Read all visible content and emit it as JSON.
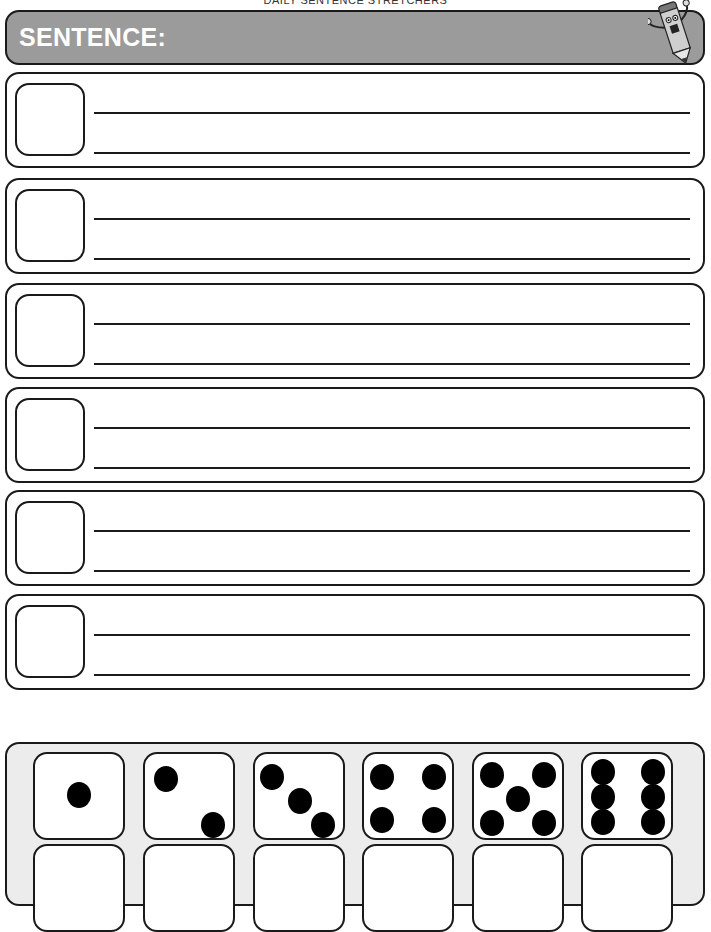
{
  "document": {
    "title": "DAILY SENTENCE STRETCHERS"
  },
  "header": {
    "label": "SENTENCE:",
    "mascot_icon": "pencil-mascot-icon",
    "background_color": "#9b9b9b"
  },
  "sentence_rows": [
    {
      "index": 1,
      "number_box": "",
      "lines": [
        "",
        ""
      ]
    },
    {
      "index": 2,
      "number_box": "",
      "lines": [
        "",
        ""
      ]
    },
    {
      "index": 3,
      "number_box": "",
      "lines": [
        "",
        ""
      ]
    },
    {
      "index": 4,
      "number_box": "",
      "lines": [
        "",
        ""
      ]
    },
    {
      "index": 5,
      "number_box": "",
      "lines": [
        "",
        ""
      ]
    },
    {
      "index": 6,
      "number_box": "",
      "lines": [
        "",
        ""
      ]
    }
  ],
  "dice_panel": {
    "background_color": "#ececec",
    "dice": [
      {
        "face": 1
      },
      {
        "face": 2
      },
      {
        "face": 3
      },
      {
        "face": 4
      },
      {
        "face": 5
      },
      {
        "face": 6
      }
    ],
    "answer_boxes": [
      "",
      "",
      "",
      "",
      "",
      ""
    ]
  }
}
